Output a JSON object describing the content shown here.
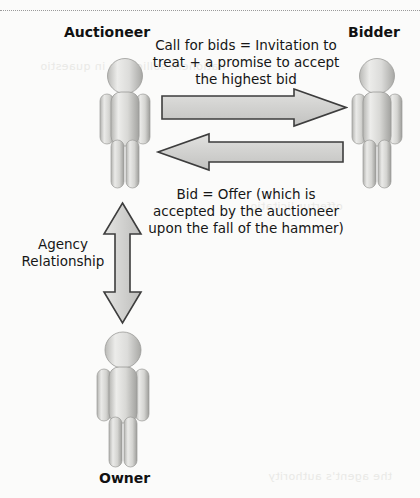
{
  "diagram": {
    "title_rule": "dotted-divider",
    "actors": {
      "auctioneer": "Auctioneer",
      "bidder": "Bidder",
      "owner": "Owner"
    },
    "notes": {
      "call_for_bids": "Call for bids = Invitation to treat + a promise to accept the highest bid",
      "bid_offer": "Bid = Offer (which is accepted by the auctioneer upon the fall of the hammer)",
      "agency": "Agency Relationship"
    },
    "arrows": [
      {
        "name": "auctioneer-to-bidder",
        "direction": "right",
        "meaning": "Call for bids"
      },
      {
        "name": "bidder-to-auctioneer",
        "direction": "left",
        "meaning": "Bid"
      },
      {
        "name": "auctioneer-to-owner",
        "direction": "both",
        "meaning": "Agency Relationship"
      }
    ],
    "colors": {
      "arrow_fill": "#d2d2d2",
      "arrow_stroke": "#3a3a3a",
      "figure_light": "#f2f2f0",
      "figure_mid": "#c9c9c7",
      "figure_dark": "#a0a09e",
      "text": "#161616",
      "background": "#fbfbfa"
    },
    "bleed_text": {
      "line_a": "nationem sollicitare in quaestio",
      "line_b": "offertur licitatio",
      "line_c": "the agent's authority"
    }
  }
}
